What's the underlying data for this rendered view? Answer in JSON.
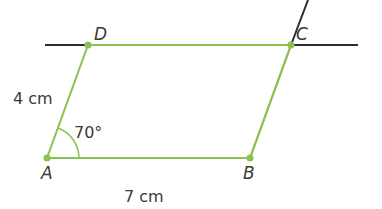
{
  "figure": {
    "type": "parallelogram",
    "vertices": {
      "A": {
        "label": "A",
        "x": 47,
        "y": 158
      },
      "B": {
        "label": "B",
        "x": 250,
        "y": 158
      },
      "C": {
        "label": "C",
        "x": 291,
        "y": 45
      },
      "D": {
        "label": "D",
        "x": 88,
        "y": 45
      }
    },
    "side_AD": "4 cm",
    "side_AB": "7 cm",
    "angle_A": "70°",
    "colors": {
      "shape": "#8cc152",
      "construction": "#2b2b33",
      "text": "#3a3a3a"
    }
  }
}
